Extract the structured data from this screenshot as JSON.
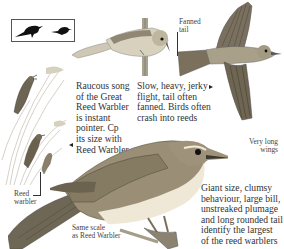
{
  "page": {
    "subject": "Great Reed Warbler",
    "colors": {
      "ink": "#2a2a2a",
      "plumage_brown": "#8a7a5e",
      "plumage_light": "#d9cfb8",
      "underparts": "#f1ebdc",
      "reed": "#b9b39c",
      "silhouette": "#111111"
    }
  },
  "silhouettes": {
    "icons": [
      "large-warbler-silhouette-icon",
      "small-warbler-silhouette-icon"
    ]
  },
  "captions": {
    "song": "Raucous song\nof the Great\nReed Warbler\nis instant\npointer. Cp\nits size with\nReed Warbler",
    "flight": "Slow, heavy, jerky\nflight, tail often\nfanned. Birds often\ncrash into reeds",
    "fanned_tail": "Fanned\ntail",
    "long_wings": "Very long\nwings",
    "reed_warbler": "Reed\nwarbler",
    "same_scale": "Same scale\nas Reed Warbler",
    "identification": "Giant size, clumsy\nbehaviour, large bill,\nunstreaked plumage\nand long rounded tail\nidentify the largest\nof the reed warblers"
  },
  "pointers": {
    "flight_arrow": "right",
    "song_arrow": "left"
  }
}
